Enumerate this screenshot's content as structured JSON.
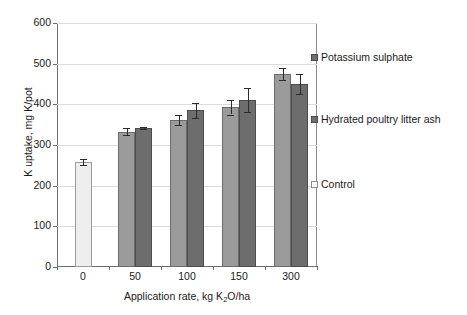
{
  "chart_data": {
    "type": "bar",
    "title": "",
    "xlabel": "Application rate, kg K2O/ha",
    "xlabel_parts": {
      "pre": "Application rate, kg K",
      "sub": "2",
      "post": "O/ha"
    },
    "ylabel": "K uptake, mg K/pot",
    "categories": [
      "0",
      "50",
      "100",
      "150",
      "300"
    ],
    "ylim": [
      0,
      600
    ],
    "ytick_labels": [
      "0",
      "100",
      "200",
      "300",
      "400",
      "500",
      "600"
    ],
    "ytick_values": [
      0,
      100,
      200,
      300,
      400,
      500,
      600
    ],
    "grid": true,
    "grid_axis": "y",
    "legend_position": "right",
    "series": [
      {
        "name": "Control",
        "color": "#eeeeee",
        "values": [
          258,
          null,
          null,
          null,
          null
        ],
        "errors": [
          8,
          null,
          null,
          null,
          null
        ]
      },
      {
        "name": "Potassium sulphate",
        "color": "#9b9b9b",
        "values": [
          null,
          333,
          362,
          393,
          474
        ],
        "errors": [
          null,
          8,
          13,
          18,
          15
        ]
      },
      {
        "name": "Hydrated poultry litter ash",
        "color": "#6d6d6d",
        "values": [
          null,
          342,
          385,
          410,
          450
        ],
        "errors": [
          null,
          3,
          18,
          30,
          25
        ]
      }
    ]
  },
  "legend": {
    "items": [
      {
        "label": "Potassium sulphate",
        "swatch": "dark-gray-square-icon"
      },
      {
        "label": "Hydrated poultry litter ash",
        "swatch": "dark-gray-square-icon"
      },
      {
        "label": "Control",
        "swatch": "white-square-icon"
      }
    ]
  },
  "axes": {
    "y_title": "K uptake, mg K/pot",
    "x_title_pre": "Application rate, kg K",
    "x_title_sub": "2",
    "x_title_post": "O/ha"
  }
}
